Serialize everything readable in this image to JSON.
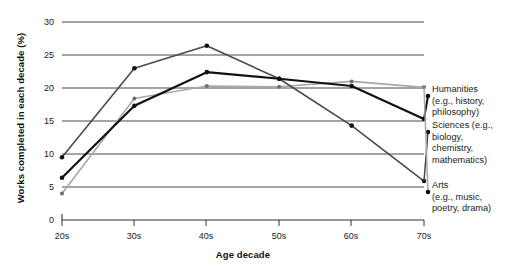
{
  "chart_data": {
    "type": "line",
    "title": "",
    "xlabel": "Age decade",
    "ylabel": "Works completed in each decade (%)",
    "categories": [
      "20s",
      "30s",
      "40s",
      "50s",
      "60s",
      "70s"
    ],
    "xticks": [
      "20s",
      "30s",
      "40s",
      "50s",
      "60s",
      "70s"
    ],
    "yticks": [
      "0",
      "5",
      "10",
      "15",
      "20",
      "25",
      "30"
    ],
    "ylim": [
      0,
      30
    ],
    "grid": "horizontal",
    "legend_position": "right",
    "series": [
      {
        "name": "Humanities",
        "legend_label": "Humanities",
        "legend_detail": "(e.g., history, philosophy)",
        "color": "#111111",
        "values": [
          6.4,
          17.3,
          22.4,
          21.4,
          20.3,
          15.3
        ]
      },
      {
        "name": "Sciences",
        "legend_label": "Sciences (e.g.,",
        "legend_detail": "biology, chemistry, mathematics)",
        "color": "#4a4a4a",
        "values": [
          9.5,
          23.0,
          26.4,
          21.4,
          14.3,
          5.9
        ]
      },
      {
        "name": "Arts",
        "legend_label": "Arts",
        "legend_detail": "(e.g., music, poetry, drama)",
        "color": "#a8a8a8",
        "values": [
          4.0,
          18.4,
          20.3,
          20.2,
          21.0,
          20.1
        ]
      }
    ]
  },
  "axis": {
    "ylabel": "Works completed in each decade (%)",
    "xlabel": "Age decade",
    "y_ticks": [
      "30",
      "25",
      "20",
      "15",
      "10",
      "5",
      "0"
    ],
    "x_ticks": [
      "20s",
      "30s",
      "40s",
      "50s",
      "60s",
      "70s"
    ]
  },
  "legend": {
    "items": [
      {
        "label": "Humanities",
        "line1": "(e.g., history,",
        "line2": "philosophy)",
        "line3": ""
      },
      {
        "label": "Sciences (e.g.,",
        "line1": "biology,",
        "line2": "chemistry,",
        "line3": "mathematics)"
      },
      {
        "label": "Arts",
        "line1": "(e.g., music,",
        "line2": "poetry, drama)",
        "line3": ""
      }
    ]
  }
}
